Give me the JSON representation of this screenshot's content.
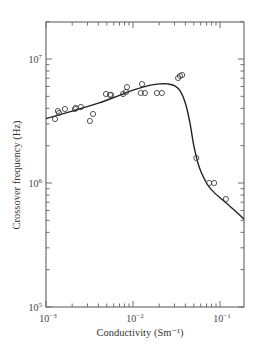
{
  "chart_data": {
    "type": "scatter",
    "title": "",
    "xlabel": "Conductivity (Sm⁻¹)",
    "ylabel": "Crossover frequency (Hz)",
    "xscale": "log",
    "yscale": "log",
    "xlim": [
      0.001,
      0.19
    ],
    "ylim": [
      100000,
      20000000
    ],
    "grid": false,
    "legend": null,
    "x_ticks": [
      {
        "value": 0.001,
        "label_base": "10",
        "label_exp": "−3"
      },
      {
        "value": 0.01,
        "label_base": "10",
        "label_exp": "−2"
      },
      {
        "value": 0.1,
        "label_base": "10",
        "label_exp": "−1"
      }
    ],
    "y_ticks": [
      {
        "value": 100000,
        "label_base": "10",
        "label_exp": "5"
      },
      {
        "value": 1000000,
        "label_base": "10",
        "label_exp": "6"
      },
      {
        "value": 10000000,
        "label_base": "10",
        "label_exp": "7"
      }
    ],
    "series": [
      {
        "name": "measured",
        "kind": "scatter",
        "marker": "open-circle",
        "x": [
          0.00127,
          0.00137,
          0.00141,
          0.00165,
          0.00215,
          0.00221,
          0.00252,
          0.0032,
          0.00347,
          0.0049,
          0.00544,
          0.00558,
          0.00767,
          0.00832,
          0.00854,
          0.0123,
          0.0127,
          0.0137,
          0.0188,
          0.0215,
          0.033,
          0.0347,
          0.0367,
          0.0534,
          0.075,
          0.0856,
          0.117
        ],
        "y": [
          3280000,
          3810000,
          3670000,
          3950000,
          3950000,
          4030000,
          4100000,
          3160000,
          3600000,
          5220000,
          5130000,
          5130000,
          5220000,
          5420000,
          5940000,
          5320000,
          6280000,
          5320000,
          5320000,
          5320000,
          7030000,
          7300000,
          7430000,
          1590000,
          1000000,
          1000000,
          743000
        ]
      },
      {
        "name": "model fit",
        "kind": "line",
        "x": [
          0.001,
          0.002,
          0.004,
          0.007,
          0.01,
          0.015,
          0.02,
          0.025,
          0.03,
          0.035,
          0.04,
          0.045,
          0.05,
          0.055,
          0.06,
          0.07,
          0.08,
          0.1,
          0.13,
          0.16,
          0.19
        ],
        "y": [
          3300000,
          3800000,
          4400000,
          5100000,
          5600000,
          6100000,
          6300000,
          6300000,
          6100000,
          5500000,
          4400000,
          3100000,
          2000000,
          1500000,
          1250000,
          1000000,
          880000,
          760000,
          650000,
          570000,
          510000
        ]
      }
    ]
  },
  "colors": {
    "axis": "#6e6e6e",
    "curve": "#222222",
    "marker": "#444444",
    "background": "#ffffff"
  }
}
